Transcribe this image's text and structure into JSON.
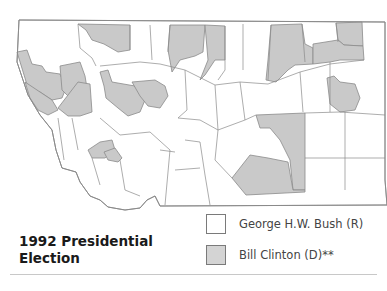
{
  "title": "1992 Presidential Election",
  "title_lines": [
    "1992 Presidential",
    "Election"
  ],
  "legend": [
    {
      "label": "George H.W. Bush (R)",
      "color": "#ffffff",
      "party": "R"
    },
    {
      "label": "Bill Clinton (D)**",
      "color": "#c9c9c9",
      "party": "D"
    }
  ],
  "map": {
    "region": "Montana counties",
    "colors": {
      "bush": "#ffffff",
      "clinton": "#c9c9c9",
      "border": "#8a8a8a"
    }
  }
}
